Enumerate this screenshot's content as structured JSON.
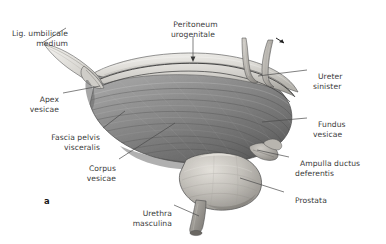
{
  "figure": {
    "panel_label": "a",
    "background_color": "#ffffff",
    "text_color": "#3a3a3a",
    "leader_color": "#4a4a4a"
  },
  "labels": [
    {
      "id": "lig-umbilicale-medium",
      "line1": "Lig. umbilicale",
      "line2": "medium",
      "align": "left",
      "x": 70,
      "y": 24
    },
    {
      "id": "peritoneum-urogenitale",
      "line1": "Peritoneum",
      "line2": "urogenitale",
      "align": "center",
      "x": 167,
      "y": 11
    },
    {
      "id": "ureter-sinister",
      "line1": "Ureter",
      "line2": "sinister",
      "align": "left",
      "x": 313,
      "y": 63
    },
    {
      "id": "fundus-vesicae",
      "line1": "Fundus",
      "line2": "vesicae",
      "align": "left",
      "x": 313,
      "y": 111
    },
    {
      "id": "ampulla-ductus-deferentis",
      "line1": "Ampulla ductus",
      "line2": "deferentis",
      "align": "left",
      "x": 295,
      "y": 150
    },
    {
      "id": "prostata",
      "line1": "Prostata",
      "line2": "",
      "align": "left",
      "x": 290,
      "y": 186
    },
    {
      "id": "apex-vesicae",
      "line1": "Apex",
      "line2": "vesicae",
      "align": "right",
      "x": 57,
      "y": 86
    },
    {
      "id": "fascia-pelvis-visceralis",
      "line1": "Fascia pelvis",
      "line2": "visceralis",
      "align": "right",
      "x": 97,
      "y": 124
    },
    {
      "id": "corpus-vesicae",
      "line1": "Corpus",
      "line2": "vesicae",
      "align": "right",
      "x": 113,
      "y": 155
    },
    {
      "id": "urethra-masculina",
      "line1": "Urethra",
      "line2": "masculina",
      "align": "right",
      "x": 168,
      "y": 200
    }
  ],
  "colors": {
    "bladder_mid": "#8a8a8a",
    "bladder_dark": "#5d5d5d",
    "bladder_light": "#c9c9c9",
    "peritoneum_light": "#e2e0dc",
    "prostate_light": "#cdcac4",
    "ureter": "#b9b6b0",
    "outline": "#4c4c4c"
  }
}
